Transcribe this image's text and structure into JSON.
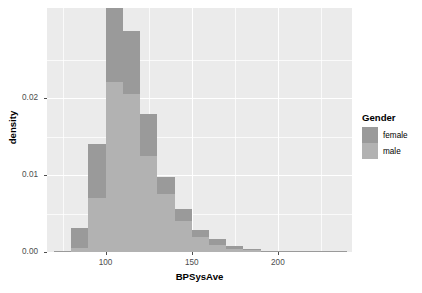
{
  "chart_data": {
    "type": "bar",
    "subtype": "stacked-histogram",
    "title": "",
    "xlabel": "BPSysAve",
    "ylabel": "density",
    "xlim": [
      66,
      243
    ],
    "ylim": [
      0,
      0.0317
    ],
    "xticks": [
      100,
      150,
      200
    ],
    "xtick_labels": [
      "100",
      "150",
      "200"
    ],
    "yticks": [
      0.0,
      0.01,
      0.02
    ],
    "ytick_labels": [
      "0.00",
      "0.01",
      "0.02"
    ],
    "xticks_minor": [
      75,
      125,
      175,
      225
    ],
    "yticks_minor": [
      0.005,
      0.015,
      0.025
    ],
    "grid": true,
    "grid_color": "#ffffff",
    "panel_background": "#ebebeb",
    "bin_width": 10,
    "bin_starts": [
      70,
      80,
      90,
      100,
      110,
      120,
      130,
      140,
      150,
      160,
      170,
      180,
      190,
      200,
      210,
      220,
      230
    ],
    "bin_centers": [
      75,
      85,
      95,
      105,
      115,
      125,
      135,
      145,
      155,
      165,
      175,
      185,
      195,
      205,
      215,
      225,
      235
    ],
    "legend_position": "right",
    "legend_title": "Gender",
    "series": [
      {
        "name": "male",
        "color": "#b2b2b2",
        "stack_order": 1,
        "values": [
          8e-05,
          0.00055,
          0.00705,
          0.02205,
          0.02055,
          0.01245,
          0.00755,
          0.004,
          0.0019,
          0.0009,
          0.00045,
          0.0002,
          0.0001,
          6e-05,
          3e-05,
          2e-05,
          1e-05
        ]
      },
      {
        "name": "female",
        "color": "#9a9a9a",
        "stack_order": 2,
        "values": [
          6e-05,
          0.0026,
          0.007,
          0.0096,
          0.0081,
          0.00545,
          0.00215,
          0.0016,
          0.0009,
          0.00075,
          0.00035,
          0.00015,
          8e-05,
          4e-05,
          3e-05,
          2e-05,
          1e-05
        ]
      }
    ],
    "totals": [
      0.00014,
      0.00315,
      0.01405,
      0.03165,
      0.02865,
      0.0179,
      0.0097,
      0.0056,
      0.0028,
      0.00165,
      0.0008,
      0.00035,
      0.00018,
      0.0001,
      6e-05,
      4e-05,
      2e-05
    ]
  },
  "axes": {
    "x_title": "BPSysAve",
    "y_title": "density"
  },
  "legend": {
    "title": "Gender",
    "entries": [
      {
        "label": "female",
        "color": "#9a9a9a"
      },
      {
        "label": "male",
        "color": "#b2b2b2"
      }
    ]
  }
}
